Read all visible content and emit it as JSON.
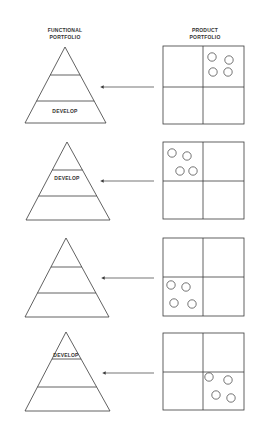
{
  "headers": {
    "functional": [
      "FUNCTIONAL",
      "PORTFOLIO"
    ],
    "product": [
      "PRODUCT",
      "PORTFOLIO"
    ]
  },
  "colors": {
    "stroke": "#3a3a3a",
    "background": "#ffffff"
  },
  "panels": [
    {
      "pyramid": {
        "apex": [
          65,
          47
        ],
        "base_y": 123,
        "base_x": [
          25,
          106
        ],
        "lines_y": [
          75,
          101
        ],
        "label": "DEVELOP",
        "label_band": "bottom",
        "label_y": 113
      },
      "matrix": {
        "x": [
          163,
          244
        ],
        "y": [
          46,
          124
        ],
        "mid": [
          203,
          87
        ],
        "highlight_quadrant": "top-right"
      },
      "circles": [
        [
          212,
          57
        ],
        [
          229,
          60
        ],
        [
          213,
          72
        ],
        [
          228,
          72
        ]
      ],
      "arrow": {
        "y": 87,
        "from_x": 154,
        "to_x": 103
      }
    },
    {
      "pyramid": {
        "apex": [
          67,
          142
        ],
        "base_y": 220,
        "base_x": [
          26,
          110
        ],
        "lines_y": [
          170,
          196
        ],
        "label": "DEVELOP",
        "label_band": "middle",
        "label_y": 180
      },
      "matrix": {
        "x": [
          163,
          244
        ],
        "y": [
          142,
          219
        ],
        "mid": [
          203,
          181
        ],
        "highlight_quadrant": "top-left"
      },
      "circles": [
        [
          172,
          153
        ],
        [
          187,
          156
        ],
        [
          180,
          171
        ],
        [
          193,
          171
        ]
      ],
      "arrow": {
        "y": 181,
        "from_x": 154,
        "to_x": 103
      }
    },
    {
      "pyramid": {
        "apex": [
          66,
          238
        ],
        "base_y": 317,
        "base_x": [
          25,
          109
        ],
        "lines_y": [
          267,
          293
        ],
        "label": "",
        "label_band": "none",
        "label_y": 0
      },
      "matrix": {
        "x": [
          163,
          244
        ],
        "y": [
          238,
          316
        ],
        "mid": [
          203,
          277
        ],
        "highlight_quadrant": "bottom-left"
      },
      "circles": [
        [
          171,
          285
        ],
        [
          186,
          287
        ],
        [
          174,
          303
        ],
        [
          192,
          304
        ]
      ],
      "arrow": {
        "y": 278,
        "from_x": 154,
        "to_x": 104
      }
    },
    {
      "pyramid": {
        "apex": [
          66,
          332
        ],
        "base_y": 411,
        "base_x": [
          25,
          110
        ],
        "lines_y": [
          359,
          387
        ],
        "label": "DEVELOP",
        "label_band": "top",
        "label_y": 357
      },
      "matrix": {
        "x": [
          163,
          244
        ],
        "y": [
          333,
          410
        ],
        "mid": [
          203,
          372
        ],
        "highlight_quadrant": "bottom-right"
      },
      "circles": [
        [
          209,
          377
        ],
        [
          228,
          380
        ],
        [
          216,
          395
        ],
        [
          231,
          398
        ]
      ],
      "arrow": {
        "y": 373,
        "from_x": 154,
        "to_x": 105
      }
    }
  ]
}
